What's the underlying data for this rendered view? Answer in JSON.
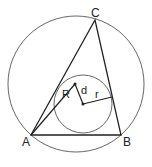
{
  "diagram": {
    "type": "geometry",
    "vertices": {
      "A": {
        "label": "A",
        "x": 31,
        "y": 135
      },
      "B": {
        "label": "B",
        "x": 121,
        "y": 135
      },
      "C": {
        "label": "C",
        "x": 95,
        "y": 20
      }
    },
    "circumcircle": {
      "cx": 76,
      "cy": 84,
      "r": 68
    },
    "incircle": {
      "cx": 83,
      "cy": 104,
      "r": 29
    },
    "circumcenter": {
      "x": 75,
      "y": 84
    },
    "incenter": {
      "x": 83,
      "y": 104
    },
    "labels": {
      "A": "A",
      "B": "B",
      "C": "C",
      "R": "R",
      "d": "d",
      "r": "r"
    },
    "colors": {
      "stroke": "#222222",
      "circle_stroke": "#555555",
      "background": "#ffffff"
    }
  }
}
